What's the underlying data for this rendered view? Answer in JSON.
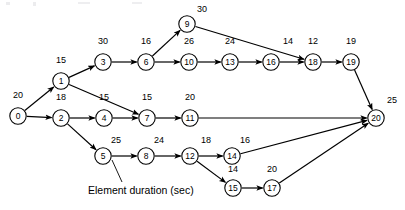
{
  "figure": {
    "type": "activity-network-diagram",
    "caption": "Element duration (sec)",
    "background_color": "#ffffff",
    "line_color": "#000000"
  },
  "chart_data": {
    "type": "diagram",
    "title": "",
    "nodes": [
      {
        "id": "0",
        "label": "0",
        "duration": "20",
        "x": 18,
        "y": 116,
        "label_x": 18,
        "label_y": 98
      },
      {
        "id": "1",
        "label": "1",
        "duration": "15",
        "x": 61,
        "y": 81,
        "label_x": 61,
        "label_y": 63
      },
      {
        "id": "2",
        "label": "2",
        "duration": "18",
        "x": 61,
        "y": 118,
        "label_x": 61,
        "label_y": 100
      },
      {
        "id": "3",
        "label": "3",
        "duration": "30",
        "x": 103,
        "y": 62,
        "label_x": 103,
        "label_y": 44
      },
      {
        "id": "4",
        "label": "4",
        "duration": "15",
        "x": 104,
        "y": 118,
        "label_x": 104,
        "label_y": 100
      },
      {
        "id": "5",
        "label": "5",
        "duration": "25",
        "x": 103,
        "y": 156,
        "label_x": 116,
        "label_y": 143
      },
      {
        "id": "6",
        "label": "6",
        "duration": "16",
        "x": 146,
        "y": 62,
        "label_x": 146,
        "label_y": 44
      },
      {
        "id": "7",
        "label": "7",
        "duration": "15",
        "x": 147,
        "y": 118,
        "label_x": 147,
        "label_y": 100
      },
      {
        "id": "8",
        "label": "8",
        "duration": "24",
        "x": 146,
        "y": 156,
        "label_x": 159,
        "label_y": 143
      },
      {
        "id": "9",
        "label": "9",
        "duration": "30",
        "x": 187,
        "y": 24,
        "label_x": 202,
        "label_y": 12
      },
      {
        "id": "10",
        "label": "10",
        "duration": "26",
        "x": 189,
        "y": 62,
        "label_x": 189,
        "label_y": 44
      },
      {
        "id": "11",
        "label": "11",
        "duration": "20",
        "x": 190,
        "y": 118,
        "label_x": 190,
        "label_y": 100
      },
      {
        "id": "12",
        "label": "12",
        "duration": "18",
        "x": 190,
        "y": 156,
        "label_x": 206,
        "label_y": 143
      },
      {
        "id": "13",
        "label": "13",
        "duration": "24",
        "x": 230,
        "y": 62,
        "label_x": 230,
        "label_y": 44
      },
      {
        "id": "14",
        "label": "14",
        "duration": "16",
        "x": 232,
        "y": 156,
        "label_x": 245,
        "label_y": 143
      },
      {
        "id": "15",
        "label": "15",
        "duration": "14",
        "x": 233,
        "y": 188,
        "label_x": 233,
        "label_y": 172
      },
      {
        "id": "16",
        "label": "16",
        "duration": "14",
        "x": 271,
        "y": 62,
        "label_x": 288,
        "label_y": 44
      },
      {
        "id": "17",
        "label": "17",
        "duration": "20",
        "x": 272,
        "y": 188,
        "label_x": 272,
        "label_y": 172
      },
      {
        "id": "18",
        "label": "18",
        "duration": "12",
        "x": 313,
        "y": 62,
        "label_x": 313,
        "label_y": 44
      },
      {
        "id": "19",
        "label": "19",
        "duration": "19",
        "x": 351,
        "y": 62,
        "label_x": 351,
        "label_y": 44
      },
      {
        "id": "20",
        "label": "20",
        "duration": "25",
        "x": 376,
        "y": 118,
        "label_x": 392,
        "label_y": 103
      }
    ],
    "edges": [
      {
        "from": "0",
        "to": "1"
      },
      {
        "from": "0",
        "to": "2"
      },
      {
        "from": "1",
        "to": "3"
      },
      {
        "from": "1",
        "to": "7"
      },
      {
        "from": "2",
        "to": "4"
      },
      {
        "from": "2",
        "to": "5"
      },
      {
        "from": "3",
        "to": "6"
      },
      {
        "from": "4",
        "to": "7"
      },
      {
        "from": "5",
        "to": "8"
      },
      {
        "from": "6",
        "to": "9"
      },
      {
        "from": "6",
        "to": "10"
      },
      {
        "from": "7",
        "to": "11"
      },
      {
        "from": "8",
        "to": "12"
      },
      {
        "from": "9",
        "to": "18"
      },
      {
        "from": "10",
        "to": "13"
      },
      {
        "from": "11",
        "to": "20"
      },
      {
        "from": "12",
        "to": "14"
      },
      {
        "from": "12",
        "to": "15"
      },
      {
        "from": "13",
        "to": "16"
      },
      {
        "from": "14",
        "to": "20"
      },
      {
        "from": "15",
        "to": "17"
      },
      {
        "from": "16",
        "to": "18"
      },
      {
        "from": "17",
        "to": "20"
      },
      {
        "from": "18",
        "to": "19"
      },
      {
        "from": "19",
        "to": "20"
      }
    ],
    "annotation": {
      "text": "Element duration (sec)",
      "text_x": 88,
      "text_y": 194,
      "leader_from_x": 122,
      "leader_from_y": 182,
      "leader_to_x": 112,
      "leader_to_y": 160,
      "points_to_node": "5"
    }
  }
}
